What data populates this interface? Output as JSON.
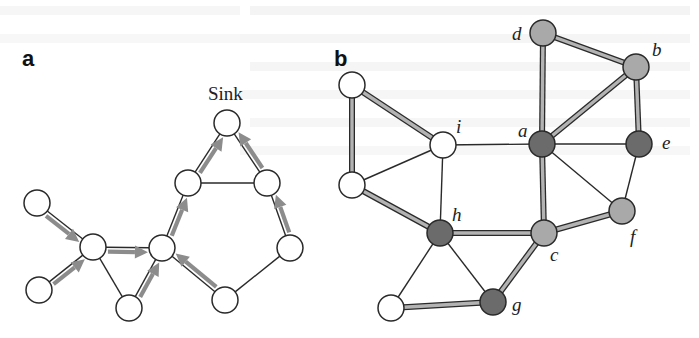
{
  "figure": {
    "panel_a": {
      "label": "a",
      "sink_label": "Sink",
      "node_radius": 13,
      "nodes": [
        {
          "id": "a1",
          "x": 37,
          "y": 203,
          "fill": "#ffffff"
        },
        {
          "id": "a2",
          "x": 39,
          "y": 290,
          "fill": "#ffffff"
        },
        {
          "id": "a3",
          "x": 93,
          "y": 247,
          "fill": "#ffffff"
        },
        {
          "id": "a4",
          "x": 129,
          "y": 308,
          "fill": "#ffffff"
        },
        {
          "id": "a5",
          "x": 162,
          "y": 248,
          "fill": "#ffffff"
        },
        {
          "id": "a6",
          "x": 188,
          "y": 183,
          "fill": "#ffffff"
        },
        {
          "id": "sink",
          "x": 227,
          "y": 123,
          "fill": "#ffffff"
        },
        {
          "id": "a8",
          "x": 267,
          "y": 183,
          "fill": "#ffffff"
        },
        {
          "id": "a9",
          "x": 290,
          "y": 248,
          "fill": "#ffffff"
        },
        {
          "id": "a10",
          "x": 225,
          "y": 300,
          "fill": "#ffffff"
        }
      ],
      "edges": [
        {
          "from": "a1",
          "to": "a3",
          "arrow": true
        },
        {
          "from": "a2",
          "to": "a3",
          "arrow": true
        },
        {
          "from": "a3",
          "to": "a5",
          "arrow": true
        },
        {
          "from": "a3",
          "to": "a4",
          "arrow": false
        },
        {
          "from": "a4",
          "to": "a5",
          "arrow": true
        },
        {
          "from": "a5",
          "to": "a6",
          "arrow": true
        },
        {
          "from": "a10",
          "to": "a5",
          "arrow": true
        },
        {
          "from": "a6",
          "to": "sink",
          "arrow": true
        },
        {
          "from": "a6",
          "to": "a8",
          "arrow": false
        },
        {
          "from": "a8",
          "to": "sink",
          "arrow": true
        },
        {
          "from": "a9",
          "to": "a8",
          "arrow": true
        },
        {
          "from": "a10",
          "to": "a9",
          "arrow": false
        }
      ]
    },
    "panel_b": {
      "label": "b",
      "node_radius": 13,
      "colors": {
        "white": "#ffffff",
        "light": "#a9a9a9",
        "dark": "#6b6b6b"
      },
      "nodes": [
        {
          "id": "tl",
          "label": "",
          "x": 352,
          "y": 85,
          "shade": "white"
        },
        {
          "id": "ml",
          "label": "",
          "x": 352,
          "y": 185,
          "shade": "white"
        },
        {
          "id": "bl",
          "label": "",
          "x": 391,
          "y": 308,
          "shade": "white"
        },
        {
          "id": "i",
          "label": "i",
          "x": 443,
          "y": 145,
          "shade": "white",
          "lx": 456,
          "ly": 133
        },
        {
          "id": "h",
          "label": "h",
          "x": 440,
          "y": 233,
          "shade": "dark",
          "lx": 452,
          "ly": 221
        },
        {
          "id": "d",
          "label": "d",
          "x": 543,
          "y": 33,
          "shade": "light",
          "lx": 512,
          "ly": 40
        },
        {
          "id": "b",
          "label": "b",
          "x": 636,
          "y": 67,
          "shade": "light",
          "lx": 652,
          "ly": 56
        },
        {
          "id": "a",
          "label": "a",
          "x": 542,
          "y": 144,
          "shade": "dark",
          "lx": 518,
          "ly": 137
        },
        {
          "id": "e",
          "label": "e",
          "x": 639,
          "y": 144,
          "shade": "dark",
          "lx": 662,
          "ly": 149
        },
        {
          "id": "f",
          "label": "f",
          "x": 622,
          "y": 211,
          "shade": "light",
          "lx": 630,
          "ly": 243
        },
        {
          "id": "c",
          "label": "c",
          "x": 544,
          "y": 233,
          "shade": "light",
          "lx": 550,
          "ly": 261
        },
        {
          "id": "g",
          "label": "g",
          "x": 493,
          "y": 302,
          "shade": "dark",
          "lx": 512,
          "ly": 311
        }
      ],
      "edges": [
        {
          "from": "tl",
          "to": "i",
          "highlight": true
        },
        {
          "from": "tl",
          "to": "ml",
          "highlight": true
        },
        {
          "from": "ml",
          "to": "i",
          "highlight": false
        },
        {
          "from": "ml",
          "to": "h",
          "highlight": true
        },
        {
          "from": "i",
          "to": "h",
          "highlight": false
        },
        {
          "from": "i",
          "to": "a",
          "highlight": false
        },
        {
          "from": "h",
          "to": "c",
          "highlight": true
        },
        {
          "from": "h",
          "to": "g",
          "highlight": false
        },
        {
          "from": "h",
          "to": "bl",
          "highlight": false
        },
        {
          "from": "bl",
          "to": "g",
          "highlight": true
        },
        {
          "from": "g",
          "to": "c",
          "highlight": true
        },
        {
          "from": "c",
          "to": "a",
          "highlight": true
        },
        {
          "from": "c",
          "to": "f",
          "highlight": true
        },
        {
          "from": "a",
          "to": "d",
          "highlight": true
        },
        {
          "from": "a",
          "to": "b",
          "highlight": true
        },
        {
          "from": "a",
          "to": "e",
          "highlight": false
        },
        {
          "from": "a",
          "to": "f",
          "highlight": false
        },
        {
          "from": "d",
          "to": "b",
          "highlight": true
        },
        {
          "from": "b",
          "to": "e",
          "highlight": true
        },
        {
          "from": "e",
          "to": "f",
          "highlight": false
        }
      ]
    }
  }
}
